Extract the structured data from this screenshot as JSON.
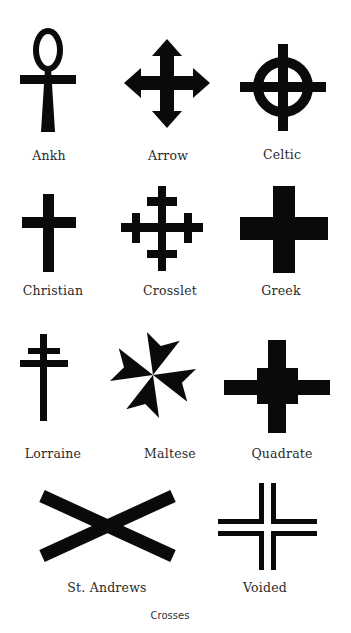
{
  "caption": "Crosses",
  "colors": {
    "ink": "#0a0a0a",
    "background": "#ffffff",
    "label": "#2a2a2a"
  },
  "crosses": [
    {
      "label": "Ankh",
      "icon": "ankh-icon"
    },
    {
      "label": "Arrow",
      "icon": "arrow-cross-icon"
    },
    {
      "label": "Celtic",
      "icon": "celtic-cross-icon"
    },
    {
      "label": "Christian",
      "icon": "christian-cross-icon"
    },
    {
      "label": "Crosslet",
      "icon": "crosslet-cross-icon"
    },
    {
      "label": "Greek",
      "icon": "greek-cross-icon"
    },
    {
      "label": "Lorraine",
      "icon": "lorraine-cross-icon"
    },
    {
      "label": "Maltese",
      "icon": "maltese-cross-icon"
    },
    {
      "label": "Quadrate",
      "icon": "quadrate-cross-icon"
    },
    {
      "label": "St. Andrews",
      "icon": "st-andrews-cross-icon"
    },
    {
      "label": "Voided",
      "icon": "voided-cross-icon"
    }
  ]
}
